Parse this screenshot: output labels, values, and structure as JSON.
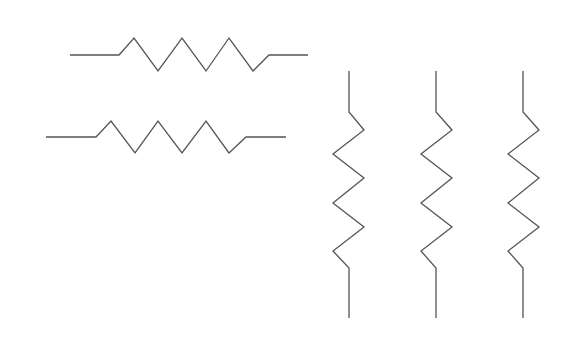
{
  "canvas": {
    "width": 570,
    "height": 342,
    "background": "#ffffff"
  },
  "stroke_color": "#555555",
  "resistors": [
    {
      "id": "horizontal-1",
      "orientation": "horizontal",
      "points": "70,55 119,55 134,38 158,71 182,38 206,71 229,38 253,71 269,55 308,55"
    },
    {
      "id": "horizontal-2",
      "orientation": "horizontal",
      "points": "46,137 96,137 111,121 135,153 158,121 182,153 206,121 229,153 246,137 286,137"
    },
    {
      "id": "vertical-1",
      "orientation": "vertical",
      "points": "349,71 349,112 364,130 333,154 364,178 333,203 364,227 333,251 349,268 349,318"
    },
    {
      "id": "vertical-2",
      "orientation": "vertical",
      "points": "436,71 436,112 452,130 421,154 452,178 421,203 452,227 421,251 436,268 436,318"
    },
    {
      "id": "vertical-3",
      "orientation": "vertical",
      "points": "523,71 523,112 539,130 508,154 539,178 508,203 539,227 508,251 523,268 523,318"
    }
  ]
}
